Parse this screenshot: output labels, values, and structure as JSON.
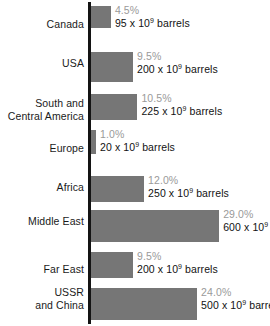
{
  "chart_data": {
    "type": "bar",
    "orientation": "horizontal",
    "title": "",
    "subtitle": "",
    "xlabel": "",
    "ylabel": "",
    "xlim": [
      0,
      30
    ],
    "grid": false,
    "legend": null,
    "unit_label": "x 10⁹ barrels",
    "categories": [
      "Canada",
      "USA",
      "South and Central America",
      "Europe",
      "Africa",
      "Middle East",
      "Far East",
      "USSR and China"
    ],
    "values": [
      4.5,
      9.5,
      10.5,
      1.0,
      12.0,
      29.0,
      9.5,
      24.0
    ],
    "series": [
      {
        "name": "Share of world oil reserves (%)",
        "values": [
          4.5,
          9.5,
          10.5,
          1.0,
          12.0,
          29.0,
          9.5,
          24.0
        ]
      },
      {
        "name": "Reserves (10^9 barrels)",
        "values": [
          95,
          200,
          225,
          20,
          250,
          600,
          200,
          500
        ]
      }
    ],
    "rows": [
      {
        "label_line1": "Canada",
        "label_line2": "",
        "percent": 4.5,
        "percent_text": "4.5%",
        "barrels": 95,
        "barrels_text": "95 x 10",
        "exponent": "9",
        "barrels_suffix": " barrels"
      },
      {
        "label_line1": "USA",
        "label_line2": "",
        "percent": 9.5,
        "percent_text": "9.5%",
        "barrels": 200,
        "barrels_text": "200 x 10",
        "exponent": "9",
        "barrels_suffix": " barrels"
      },
      {
        "label_line1": "South and",
        "label_line2": "Central America",
        "percent": 10.5,
        "percent_text": "10.5%",
        "barrels": 225,
        "barrels_text": "225 x 10",
        "exponent": "9",
        "barrels_suffix": " barrels"
      },
      {
        "label_line1": "Europe",
        "label_line2": "",
        "percent": 1.0,
        "percent_text": "1.0%",
        "barrels": 20,
        "barrels_text": "20 x 10",
        "exponent": "9",
        "barrels_suffix": " barrels"
      },
      {
        "label_line1": "Africa",
        "label_line2": "",
        "percent": 12.0,
        "percent_text": "12.0%",
        "barrels": 250,
        "barrels_text": "250 x 10",
        "exponent": "9",
        "barrels_suffix": " barrels"
      },
      {
        "label_line1": "Middle East",
        "label_line2": "",
        "percent": 29.0,
        "percent_text": "29.0%",
        "barrels": 600,
        "barrels_text": "600 x 10",
        "exponent": "9",
        "barrels_suffix": " barrels"
      },
      {
        "label_line1": "Far East",
        "label_line2": "",
        "percent": 9.5,
        "percent_text": "9.5%",
        "barrels": 200,
        "barrels_text": "200 x 10",
        "exponent": "9",
        "barrels_suffix": " barrels"
      },
      {
        "label_line1": "USSR",
        "label_line2": "and China",
        "percent": 24.0,
        "percent_text": "24.0%",
        "barrels": 500,
        "barrels_text": "500 x 10",
        "exponent": "9",
        "barrels_suffix": " barrels"
      }
    ],
    "colors": {
      "bar": "#767676",
      "axis": "#141414",
      "percent_text": "#9a9a9a",
      "value_text": "#121212",
      "label_text": "#1a1a1a",
      "background": "#ffffff"
    }
  }
}
